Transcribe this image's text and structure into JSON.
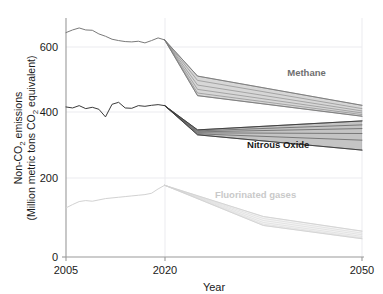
{
  "chart_data": {
    "type": "line",
    "title": "",
    "xlabel": "Year",
    "ylabel": "Non-CO2 emissions (Million metric tons CO2 equivalent)",
    "ylabel_line1": "Non-CO",
    "ylabel_line1_sub": "2",
    "ylabel_line1_rest": " emissions",
    "ylabel_line2_a": "(Million metric tons CO",
    "ylabel_line2_sub": "2",
    "ylabel_line2_b": " equivalent)",
    "xlim": [
      2005,
      2050
    ],
    "ylim": [
      0,
      720
    ],
    "xticks": [
      2005,
      2020,
      2050
    ],
    "xtick_labels": [
      "2005",
      "2020",
      "2050"
    ],
    "yticks": [
      0,
      200,
      400,
      600
    ],
    "ytick_labels": [
      "0",
      "200",
      "400",
      "600"
    ],
    "grid": true,
    "grid_color": "#e8e8ec",
    "legend_position": "inline-right",
    "history_range": [
      2005,
      2020
    ],
    "projection_range": [
      2020,
      2050
    ],
    "series": [
      {
        "name": "Methane",
        "color": "#7a7a7a",
        "label": "Methane",
        "label_color": "#6f6f6f",
        "label_x": 2044.5,
        "label_y": 545,
        "history": {
          "x": [
            2005,
            2006,
            2007,
            2008,
            2009,
            2010,
            2011,
            2012,
            2013,
            2014,
            2015,
            2016,
            2017,
            2018,
            2019,
            2020
          ],
          "y": [
            676,
            684,
            690,
            684,
            683,
            672,
            665,
            656,
            652,
            649,
            648,
            650,
            645,
            652,
            660,
            654
          ]
        },
        "projection_scenarios": [
          {
            "x": [
              2020,
              2025,
              2050
            ],
            "y": [
              654,
              545,
              457
            ]
          },
          {
            "x": [
              2020,
              2025,
              2050
            ],
            "y": [
              654,
              532,
              447
            ]
          },
          {
            "x": [
              2020,
              2025,
              2050
            ],
            "y": [
              654,
              518,
              440
            ]
          },
          {
            "x": [
              2020,
              2025,
              2050
            ],
            "y": [
              654,
              505,
              434
            ]
          },
          {
            "x": [
              2020,
              2025,
              2050
            ],
            "y": [
              654,
              494,
              429
            ]
          },
          {
            "x": [
              2020,
              2025,
              2050
            ],
            "y": [
              654,
              486,
              424
            ]
          }
        ],
        "band_2025": [
          486,
          545
        ],
        "band_2050": [
          424,
          457
        ]
      },
      {
        "name": "Nitrous Oxide",
        "color": "#3a3a3a",
        "label": "Nitrous Oxide",
        "label_color": "#1a1a1a",
        "label_x": 2042,
        "label_y": 330,
        "history": {
          "x": [
            2005,
            2006,
            2007,
            2008,
            2009,
            2010,
            2011,
            2012,
            2013,
            2014,
            2015,
            2016,
            2017,
            2018,
            2019,
            2020
          ],
          "y": [
            452,
            449,
            456,
            447,
            451,
            445,
            422,
            460,
            466,
            449,
            448,
            456,
            454,
            457,
            459,
            456
          ]
        },
        "projection_scenarios": [
          {
            "x": [
              2020,
              2025,
              2050
            ],
            "y": [
              456,
              383,
              410
            ]
          },
          {
            "x": [
              2020,
              2025,
              2050
            ],
            "y": [
              456,
              380,
              398
            ]
          },
          {
            "x": [
              2020,
              2025,
              2050
            ],
            "y": [
              456,
              377,
              387
            ]
          },
          {
            "x": [
              2020,
              2025,
              2050
            ],
            "y": [
              456,
              374,
              372
            ]
          },
          {
            "x": [
              2020,
              2025,
              2050
            ],
            "y": [
              456,
              371,
              352
            ]
          },
          {
            "x": [
              2020,
              2025,
              2050
            ],
            "y": [
              456,
              368,
              322
            ]
          }
        ],
        "band_2025": [
          368,
          383
        ],
        "band_2050": [
          322,
          410
        ]
      },
      {
        "name": "Fluorinated gases",
        "color": "#d2d2d2",
        "label": "Fluorinated gases",
        "label_color": "#c9c9c9",
        "label_x": 2040,
        "label_y": 178,
        "history": {
          "x": [
            2005,
            2006,
            2007,
            2008,
            2009,
            2010,
            2011,
            2012,
            2013,
            2014,
            2015,
            2016,
            2017,
            2018,
            2019,
            2020
          ],
          "y": [
            148,
            158,
            167,
            170,
            168,
            172,
            176,
            178,
            180,
            182,
            184,
            186,
            188,
            192,
            205,
            216
          ]
        },
        "projection_scenarios": [
          {
            "x": [
              2020,
              2035,
              2050
            ],
            "y": [
              216,
              122,
              78
            ]
          },
          {
            "x": [
              2020,
              2035,
              2050
            ],
            "y": [
              216,
              116,
              72
            ]
          },
          {
            "x": [
              2020,
              2035,
              2050
            ],
            "y": [
              216,
              110,
              67
            ]
          },
          {
            "x": [
              2020,
              2035,
              2050
            ],
            "y": [
              216,
              104,
              62
            ]
          },
          {
            "x": [
              2020,
              2035,
              2050
            ],
            "y": [
              216,
              99,
              58
            ]
          },
          {
            "x": [
              2020,
              2035,
              2050
            ],
            "y": [
              216,
              95,
              55
            ]
          }
        ],
        "band_2035": [
          95,
          122
        ],
        "band_2050": [
          55,
          78
        ]
      }
    ]
  }
}
